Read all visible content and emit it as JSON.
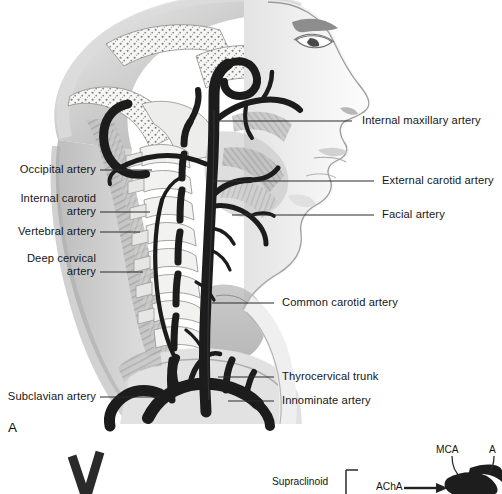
{
  "figure": {
    "panel_a_letter": "A",
    "title_implicit": "Extracranial cervicocerebral arterial anatomy, lateral view"
  },
  "labels_left": [
    {
      "name": "occipital-artery",
      "text": "Occipital artery",
      "x": 12,
      "y": 163,
      "w": 84,
      "line_x1": 100,
      "line_x2": 152,
      "line_y": 170
    },
    {
      "name": "internal-carotid-artery",
      "text": "Internal carotid\nartery",
      "x": 10,
      "y": 192,
      "w": 86,
      "line_x1": 100,
      "line_x2": 150,
      "line_y": 212
    },
    {
      "name": "vertebral-artery",
      "text": "Vertebral artery",
      "x": 10,
      "y": 225,
      "w": 86,
      "line_x1": 100,
      "line_x2": 140,
      "line_y": 232
    },
    {
      "name": "deep-cervical-artery",
      "text": "Deep cervical\nartery",
      "x": 12,
      "y": 252,
      "w": 84,
      "line_x1": 100,
      "line_x2": 143,
      "line_y": 272
    },
    {
      "name": "subclavian-artery",
      "text": "Subclavian artery",
      "x": 2,
      "y": 390,
      "w": 94,
      "line_x1": 100,
      "line_x2": 160,
      "line_y": 397
    }
  ],
  "labels_right": [
    {
      "name": "internal-maxillary-artery",
      "text": "Internal maxillary artery",
      "x": 362,
      "y": 114,
      "line_x1": 352,
      "line_x2": 218,
      "line_y": 121
    },
    {
      "name": "external-carotid-artery",
      "text": "External carotid artery",
      "x": 382,
      "y": 174,
      "line_x1": 374,
      "line_x2": 214,
      "line_y": 181
    },
    {
      "name": "facial-artery",
      "text": "Facial artery",
      "x": 382,
      "y": 208,
      "line_x1": 374,
      "line_x2": 232,
      "line_y": 215
    },
    {
      "name": "common-carotid-artery",
      "text": "Common carotid artery",
      "x": 282,
      "y": 296,
      "line_x1": 274,
      "line_x2": 212,
      "line_y": 303
    },
    {
      "name": "thyrocervical-trunk",
      "text": "Thyrocervical trunk",
      "x": 282,
      "y": 370,
      "line_x1": 274,
      "line_x2": 218,
      "line_y": 377
    },
    {
      "name": "innominate-artery",
      "text": "Innominate artery",
      "x": 282,
      "y": 394,
      "line_x1": 274,
      "line_x2": 228,
      "line_y": 401
    }
  ],
  "panel_b": {
    "supraclinoid_label": "Supraclinoid",
    "acha_label": "AChA",
    "mca_label": "MCA",
    "aca_label_clipped": "A",
    "v_marker": "V"
  },
  "palette": {
    "artery_dark": "#1c1c1c",
    "bone_light": "#f1f1ef",
    "muscle_mid": "#9b9b9b",
    "muscle_light": "#c9c9c9",
    "skin_shade": "#d8d8d8",
    "background": "#ffffff",
    "leader_line": "#2b2b2b",
    "text": "#161616"
  }
}
